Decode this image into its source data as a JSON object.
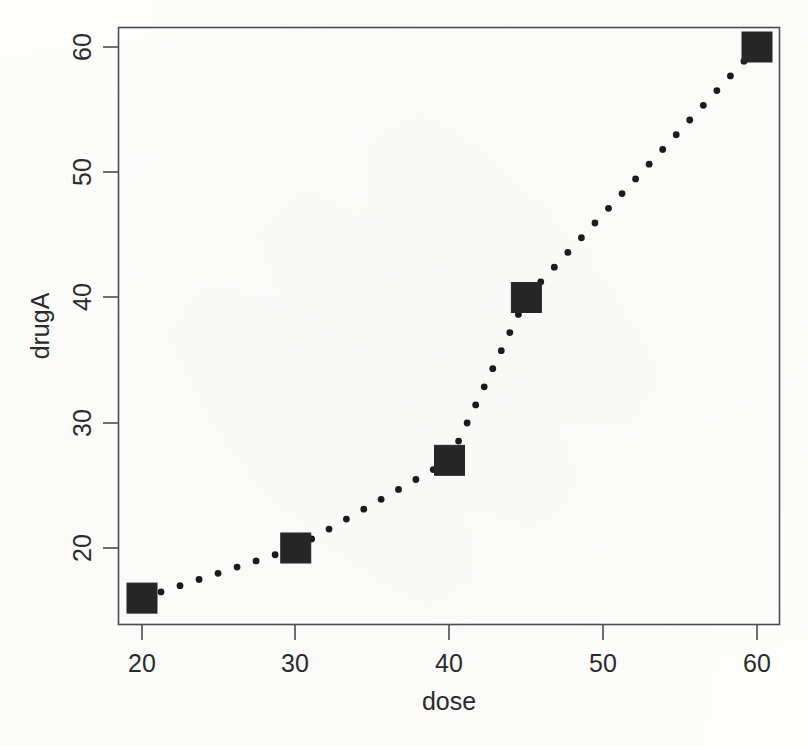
{
  "chart_data": {
    "type": "scatter",
    "title": "",
    "xlabel": "dose",
    "ylabel": "drugA",
    "x": [
      20,
      30,
      40,
      45,
      60
    ],
    "values": [
      16,
      20,
      27,
      40,
      60
    ],
    "series": [
      {
        "name": "drugA",
        "x": [
          20,
          30,
          40,
          45,
          60
        ],
        "values": [
          16,
          20,
          27,
          40,
          60
        ]
      }
    ],
    "points": [
      {
        "x": 20,
        "y": 16
      },
      {
        "x": 30,
        "y": 20
      },
      {
        "x": 40,
        "y": 27
      },
      {
        "x": 45,
        "y": 40
      },
      {
        "x": 60,
        "y": 60
      }
    ],
    "xlim": [
      16.2,
      61.5
    ],
    "ylim": [
      14.5,
      61.6
    ],
    "xticks": [
      20,
      30,
      40,
      50,
      60
    ],
    "yticks": [
      20,
      30,
      40,
      50,
      60
    ],
    "xtick_labels": [
      "20",
      "30",
      "40",
      "50",
      "60"
    ],
    "ytick_labels": [
      "20",
      "30",
      "40",
      "50",
      "60"
    ],
    "grid": false,
    "legend": false,
    "legend_position": "none",
    "line_style": "dotted",
    "marker": "filled-square",
    "marker_color": "#262626",
    "line_color": "#1b1b1b",
    "frame": "box",
    "ytick_label_rotation": 90,
    "ylabel_rotation": 90
  }
}
